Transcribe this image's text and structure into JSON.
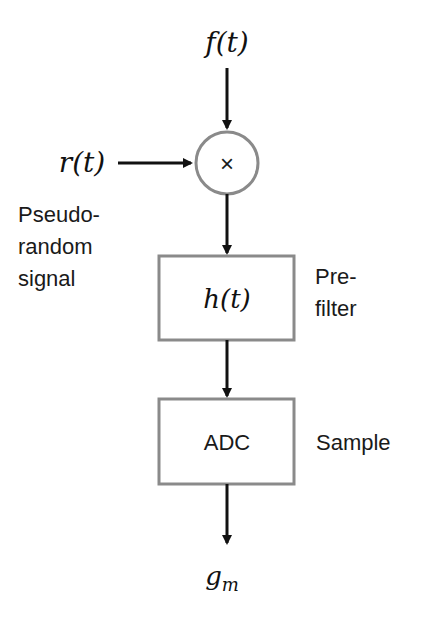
{
  "diagram": {
    "input_signal": "f(t)",
    "mixer_signal": "r(t)",
    "mixer_symbol": "×",
    "mixer_caption": [
      "Pseudo-",
      "random",
      "signal"
    ],
    "filter_block": {
      "label": "h(t)",
      "caption": [
        "Pre-",
        "filter"
      ]
    },
    "adc_block": {
      "label": "ADC",
      "caption": "Sample"
    },
    "output_signal": "g",
    "output_subscript": "m"
  },
  "colors": {
    "line": "#111111",
    "block_border": "#8a8a8a",
    "background": "#ffffff"
  }
}
